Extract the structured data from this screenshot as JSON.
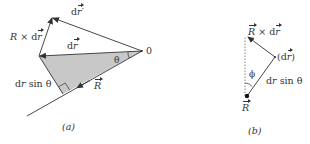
{
  "figure": {
    "panel_a": {
      "caption": "(a)",
      "labels": {
        "origin": "0",
        "theta": "θ",
        "dr_prime": "dr′",
        "dr": "dr",
        "R_cross_dr": "R × dr",
        "dr_sin_theta": "dr sin θ",
        "R": "R"
      }
    },
    "panel_b": {
      "caption": "(b)",
      "labels": {
        "R_cross_dr": "R × dr",
        "dr_point": "(dr)",
        "phi": "ϕ",
        "dr_sin_theta": "dr sin θ",
        "R": "R"
      }
    },
    "colors": {
      "line": "#333333",
      "shade": "#c8c8c8",
      "background": "#ffffff"
    }
  }
}
